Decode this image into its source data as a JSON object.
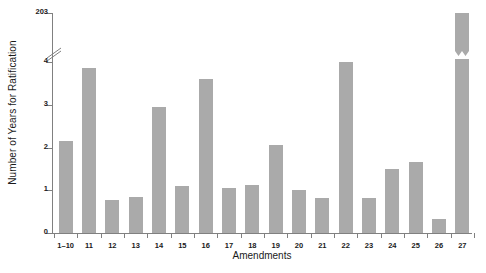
{
  "chart_data": {
    "type": "bar",
    "title": "",
    "xlabel": "Amendments",
    "ylabel": "Number of Years for Ratification",
    "categories": [
      "1–10",
      "11",
      "12",
      "13",
      "14",
      "15",
      "16",
      "17",
      "18",
      "19",
      "20",
      "21",
      "22",
      "23",
      "24",
      "25",
      "26",
      "27"
    ],
    "values": [
      2.15,
      3.85,
      0.78,
      0.85,
      2.95,
      1.1,
      3.6,
      1.05,
      1.13,
      2.05,
      1.0,
      0.83,
      4.0,
      0.83,
      1.5,
      1.65,
      0.32,
      203
    ],
    "ytick_labels": [
      "0",
      "1",
      "2",
      "3",
      "4",
      "203"
    ],
    "ytick_values": [
      0,
      1,
      2,
      3,
      4,
      203
    ],
    "ylim": [
      0,
      203
    ],
    "axis_break": {
      "present": true,
      "between": [
        4,
        203
      ],
      "note": "y-axis broken between 4 and 203; the 27th amendment bar carries a matching break mark"
    },
    "grid": false,
    "legend": null,
    "bar_color": "#aaaaaa",
    "axis_color": "#808080"
  }
}
